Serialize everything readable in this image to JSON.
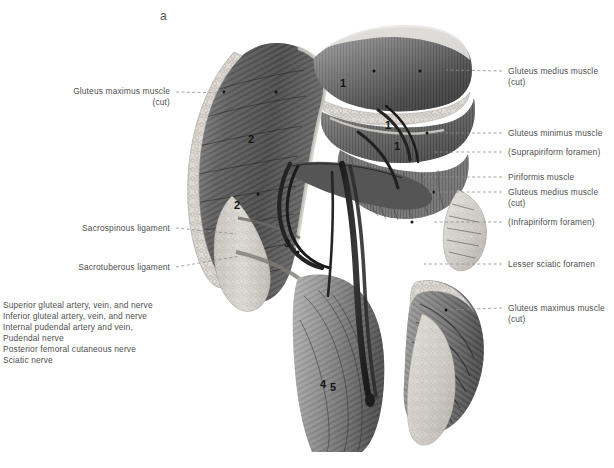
{
  "figure": {
    "letter": "a",
    "caption": ""
  },
  "labels_left": [
    {
      "name": "gluteus-maximus-cut-left",
      "line1": "Gluteus maximus muscle",
      "line2": "(cut)",
      "x": 78,
      "y": 86,
      "right_edge": 170,
      "leader": {
        "x1": 175,
        "y1": 92,
        "x2": 224,
        "y2": 92
      }
    },
    {
      "name": "sacrospinous-ligament",
      "line1": "Sacrospinous ligament",
      "line2": "",
      "x": 75,
      "y": 223,
      "right_edge": 170,
      "leader": {
        "x1": 175,
        "y1": 228,
        "x2": 231,
        "y2": 233
      }
    },
    {
      "name": "sacrotuberous-ligament",
      "line1": "Sacrotuberous ligament",
      "line2": "",
      "x": 73,
      "y": 262,
      "right_edge": 170,
      "leader": {
        "x1": 175,
        "y1": 267,
        "x2": 234,
        "y2": 256
      }
    }
  ],
  "labels_right": [
    {
      "name": "gluteus-medius-cut-upper",
      "line1": "Gluteus medius muscle",
      "line2": "(cut)",
      "x": 508,
      "y": 66,
      "leader": {
        "x1": 503,
        "y1": 71,
        "x2": 447,
        "y2": 71
      }
    },
    {
      "name": "gluteus-minimus-muscle",
      "line1": "Gluteus minimus muscle",
      "line2": "",
      "x": 508,
      "y": 128,
      "leader": {
        "x1": 503,
        "y1": 133,
        "x2": 430,
        "y2": 133
      }
    },
    {
      "name": "suprapiriform-foramen",
      "line1": "(Suprapiriform foramen)",
      "line2": "",
      "x": 508,
      "y": 147,
      "leader": {
        "x1": 503,
        "y1": 152,
        "x2": 430,
        "y2": 152
      }
    },
    {
      "name": "piriformis-muscle",
      "line1": "Piriformis muscle",
      "line2": "",
      "x": 508,
      "y": 172,
      "leader": {
        "x1": 503,
        "y1": 177,
        "x2": 424,
        "y2": 177
      }
    },
    {
      "name": "gluteus-medius-cut-lower",
      "line1": "Gluteus medius muscle",
      "line2": "(cut)",
      "x": 508,
      "y": 187,
      "leader": {
        "x1": 503,
        "y1": 192,
        "x2": 427,
        "y2": 192
      }
    },
    {
      "name": "infrapiriform-foramen",
      "line1": "(Infrapiriform foramen)",
      "line2": "",
      "x": 508,
      "y": 217,
      "leader": {
        "x1": 503,
        "y1": 222,
        "x2": 432,
        "y2": 222
      }
    },
    {
      "name": "lesser-sciatic-foramen",
      "line1": "Lesser sciatic foramen",
      "line2": "",
      "x": 508,
      "y": 259,
      "leader": {
        "x1": 503,
        "y1": 264,
        "x2": 424,
        "y2": 264
      }
    },
    {
      "name": "gluteus-maximus-cut-right",
      "line1": "Gluteus maximus muscle",
      "line2": "(cut)",
      "x": 508,
      "y": 303,
      "leader": {
        "x1": 503,
        "y1": 308,
        "x2": 446,
        "y2": 310
      }
    }
  ],
  "legend": {
    "items": [
      "Superior gluteal artery, vein, and nerve",
      "Inferior gluteal artery, vein, and nerve",
      "Internal pudendal artery and vein,",
      "Pudendal nerve",
      "Posterior femoral cutaneous nerve",
      "Sciatic nerve"
    ]
  },
  "markers": [
    {
      "text": "1",
      "x": 340,
      "y": 83
    },
    {
      "text": "1",
      "x": 385,
      "y": 125
    },
    {
      "text": "1",
      "x": 394,
      "y": 146
    },
    {
      "text": "2",
      "x": 248,
      "y": 139
    },
    {
      "text": "2",
      "x": 234,
      "y": 205
    },
    {
      "text": "3",
      "x": 284,
      "y": 243
    },
    {
      "text": "4",
      "x": 320,
      "y": 384
    },
    {
      "text": "5",
      "x": 330,
      "y": 387
    }
  ],
  "colors": {
    "background": "#ffffff",
    "label_text": "#4f4f4f",
    "leader_line": "#8e8e8e",
    "marker_text": "#141414",
    "plate_dark": "#2b2b2b",
    "plate_mid": "#7d7d7d",
    "plate_light": "#d8d8d8",
    "bone_light": "#e6e3de"
  }
}
